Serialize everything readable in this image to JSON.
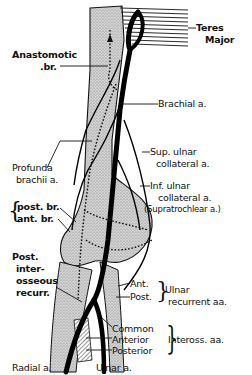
{
  "diagram": {
    "colors": {
      "background": "#ffffff",
      "ink": "#111111",
      "bone_fill": "#c9c9c9",
      "stipple": "#8a8a8a"
    },
    "labels": {
      "teres_major_line1": "Teres",
      "teres_major_line2": "Major",
      "anastomotic_line1": "Anastomotic",
      "anastomotic_line2": ".br.",
      "brachial": "Brachial a.",
      "sup_ulnar_line1": "Sup. ulnar",
      "sup_ulnar_line2": "collateral a.",
      "profunda_line1": "Profunda",
      "profunda_line2": "brachii a.",
      "inf_ulnar_line1": "Inf. ulnar",
      "inf_ulnar_line2": "collateral a.",
      "inf_ulnar_line3": "(Supratrochlear a.)",
      "post_br": "post. br.",
      "ant_br": "ant. br.",
      "post_interosseous_line1": "Post.",
      "post_interosseous_line2": "inter-",
      "post_interosseous_line3": "osseous",
      "post_interosseous_line4": "recurr.",
      "ulnar_recurrent_ant": "Ant.",
      "ulnar_recurrent_post": "Post.",
      "ulnar_recurrent_group_line1": "Ulnar",
      "ulnar_recurrent_group_line2": "recurrent aa.",
      "interosseous_common": "Common",
      "interosseous_anterior": "Anterior",
      "interosseous_posterior": "Posterior",
      "interosseous_group": "Inteross. aa.",
      "radial": "Radial a.",
      "ulnar": "Ulnar a."
    }
  }
}
